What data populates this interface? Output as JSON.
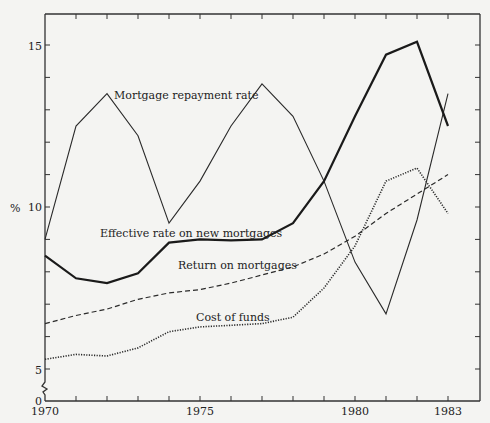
{
  "chart_data": {
    "type": "line",
    "title": "",
    "xlabel": "",
    "ylabel": "%",
    "x": [
      1970,
      1971,
      1972,
      1973,
      1974,
      1975,
      1976,
      1977,
      1978,
      1979,
      1980,
      1981,
      1982,
      1983
    ],
    "xticks_labeled": [
      "1970",
      "1975",
      "1980",
      "1983"
    ],
    "yticks_labeled": [
      "0",
      "5",
      "10",
      "15"
    ],
    "xlim": [
      1970,
      1983.7
    ],
    "ylim": [
      0,
      16
    ],
    "y_axis_break": "between 0 and 5",
    "grid": false,
    "legend": "inline labels",
    "series": [
      {
        "name": "Mortgage repayment rate",
        "style": "thin solid",
        "values": [
          9.0,
          12.5,
          13.5,
          12.2,
          9.5,
          10.8,
          12.5,
          13.8,
          12.8,
          10.8,
          8.3,
          6.7,
          9.6,
          13.5
        ]
      },
      {
        "name": "Effective rate on new mortgages",
        "style": "thick solid",
        "values": [
          8.5,
          7.8,
          7.65,
          7.95,
          8.9,
          9.0,
          8.97,
          9.0,
          9.5,
          10.8,
          12.8,
          14.7,
          15.1,
          12.5
        ]
      },
      {
        "name": "Return on mortgages",
        "style": "dashed",
        "values": [
          6.4,
          6.65,
          6.85,
          7.15,
          7.35,
          7.45,
          7.65,
          7.9,
          8.15,
          8.55,
          9.1,
          9.8,
          10.4,
          11.0
        ]
      },
      {
        "name": "Cost of funds",
        "style": "dotted",
        "values": [
          5.3,
          5.45,
          5.4,
          5.65,
          6.15,
          6.3,
          6.35,
          6.4,
          6.6,
          7.5,
          8.8,
          10.8,
          11.2,
          9.8
        ]
      }
    ]
  },
  "labels": {
    "y_unit": "%",
    "series_mortgage_repayment": "Mortgage repayment rate",
    "series_effective_rate": "Effective rate on new mortgages",
    "series_return": "Return on mortgages",
    "series_cost": "Cost of funds",
    "x_1970": "1970",
    "x_1975": "1975",
    "x_1980": "1980",
    "x_1983": "1983",
    "y_0": "0",
    "y_5": "5",
    "y_10": "10",
    "y_15": "15"
  }
}
